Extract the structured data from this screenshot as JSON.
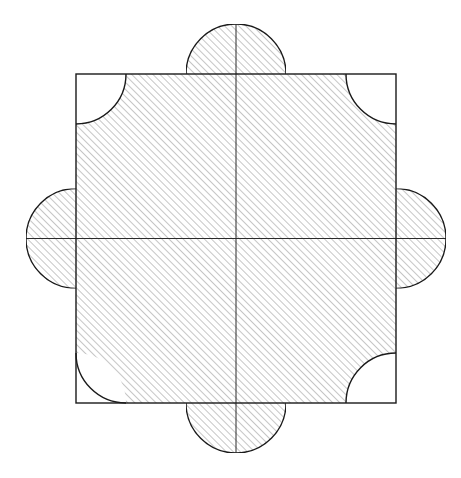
{
  "page": {
    "background_color": "#ffffff",
    "width": 461,
    "height": 478
  },
  "figure": {
    "name": "square-with-four-semicircles-and-four-corner-cuts",
    "description": "A square outline with four hatched semicircular lobes attached to the midpoints of its edges and four unhatched quarter-circle notches removed from its corners. Two thin center lines (a vertical and a horizontal axis) pass through the whole figure.",
    "stroke_color": "#1a1a1a",
    "hatch_color": "#808080",
    "fill_color": "#ffffff",
    "stroke_width": 1.4,
    "hatch_stroke_width": 0.9,
    "hatch_spacing": 5,
    "hatch_angle_deg": 45,
    "hatch_direction": "bottom-left to top-right",
    "axis_stroke_width": 1.0
  },
  "geometry": {
    "square": {
      "label": "square-outline",
      "x": 76,
      "y": 74,
      "width": 320,
      "height": 329,
      "left": 76,
      "top": 74,
      "right": 396,
      "bottom": 403
    },
    "center": {
      "label": "center-point",
      "x": 236,
      "y": 238.5
    },
    "circle_radius": 50,
    "lobes": [
      {
        "name": "top-semicircle",
        "cx": 236,
        "cy": 74,
        "r": 50,
        "orientation": "up",
        "hatched": true
      },
      {
        "name": "right-semicircle",
        "cx": 396,
        "cy": 238.5,
        "r": 50,
        "orientation": "right",
        "hatched": true
      },
      {
        "name": "bottom-semicircle",
        "cx": 236,
        "cy": 403,
        "r": 50,
        "orientation": "down",
        "hatched": true
      },
      {
        "name": "left-semicircle",
        "cx": 76,
        "cy": 238.5,
        "r": 50,
        "orientation": "left",
        "hatched": true
      }
    ],
    "corner_cuts": [
      {
        "name": "top-left-quarter-cut",
        "cx": 76,
        "cy": 74,
        "r": 50,
        "hatched": false
      },
      {
        "name": "top-right-quarter-cut",
        "cx": 396,
        "cy": 74,
        "r": 50,
        "hatched": false
      },
      {
        "name": "bottom-right-quarter-cut",
        "cx": 396,
        "cy": 403,
        "r": 50,
        "hatched": false
      },
      {
        "name": "bottom-left-quarter-cut",
        "cx": 76,
        "cy": 403,
        "r": 50,
        "hatched": false
      }
    ],
    "axes": [
      {
        "name": "vertical-center-line",
        "x1": 236,
        "y1": 24,
        "x2": 236,
        "y2": 453
      },
      {
        "name": "horizontal-center-line",
        "x1": 26,
        "y1": 238.5,
        "x2": 446,
        "y2": 238.5
      }
    ]
  },
  "labels": {
    "none": ""
  }
}
